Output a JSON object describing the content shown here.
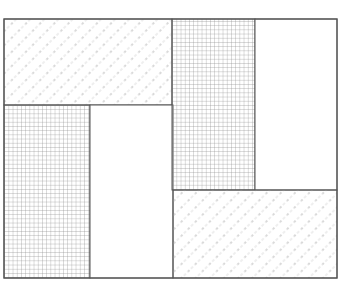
{
  "diagram": {
    "type": "rectangle-tiling",
    "frame": {
      "x": 4,
      "y": 19,
      "width": 333,
      "height": 259
    },
    "stroke_color": "#555555",
    "grid_color": "#8a8a8a",
    "hatch_color": "#d2d2d2",
    "hatch_dot_color": "#bdbdbd",
    "regions": [
      {
        "id": "A",
        "fill": "hatch",
        "x": 4,
        "y": 19,
        "width": 168,
        "height": 86
      },
      {
        "id": "B",
        "fill": "grid",
        "x": 4,
        "y": 105,
        "width": 86,
        "height": 173
      },
      {
        "id": "C",
        "fill": "blank",
        "x": 90,
        "y": 105,
        "width": 83,
        "height": 173
      },
      {
        "id": "D",
        "fill": "grid",
        "x": 172,
        "y": 19,
        "width": 83,
        "height": 171
      },
      {
        "id": "E",
        "fill": "blank",
        "x": 255,
        "y": 19,
        "width": 82,
        "height": 171
      },
      {
        "id": "F",
        "fill": "hatch",
        "x": 173,
        "y": 190,
        "width": 164,
        "height": 88
      }
    ]
  }
}
